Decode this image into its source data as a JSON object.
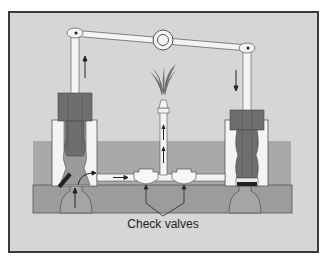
{
  "figure": {
    "labels": {
      "check_valves": "Check valves"
    },
    "colors": {
      "background": "#d6d6d6",
      "frame_border": "#3a3a3a",
      "water": "#a9a9a9",
      "base": "#9c9c9c",
      "cylinder": "#f4f4f4",
      "piston": "#6e6e6e",
      "piston_core": "#8a8a8a",
      "valve_flap": "#222222",
      "spray": "#6f6f6f"
    },
    "components": [
      {
        "name": "rocking-beam",
        "type": "lever"
      },
      {
        "name": "beam-pivot",
        "type": "ring"
      },
      {
        "name": "left-piston-rod",
        "direction": "up"
      },
      {
        "name": "right-piston-rod",
        "direction": "down"
      },
      {
        "name": "left-cylinder"
      },
      {
        "name": "right-cylinder"
      },
      {
        "name": "check-valve-left"
      },
      {
        "name": "check-valve-right"
      },
      {
        "name": "fountain-pipe",
        "direction": "up"
      },
      {
        "name": "fountain-spray"
      }
    ]
  }
}
